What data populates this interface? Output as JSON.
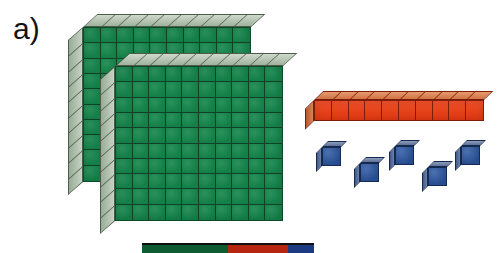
{
  "figure": {
    "label": "a)",
    "kind": "base-ten-blocks",
    "represented_value": 215,
    "background_color": "#ffffff",
    "width": 498,
    "height": 253
  },
  "groups": {
    "hundreds": {
      "name": "hundred-flat",
      "count": 2,
      "unit_value": 100,
      "grid_rows": 10,
      "grid_cols": 10,
      "color": "#13854a",
      "edge_color": "#0c4a2a",
      "bevel_color": "#b7c6b4",
      "items": [
        {
          "id": "flat-back",
          "left": 68,
          "top": 14
        },
        {
          "id": "flat-front",
          "left": 100,
          "top": 53
        }
      ]
    },
    "tens": {
      "name": "ten-rod",
      "count": 1,
      "unit_value": 10,
      "segments": 10,
      "color": "#eb3b11",
      "edge_color": "#7d1c08",
      "bevel_color": "#e79b6d",
      "items": [
        {
          "id": "rod-1",
          "left": 305,
          "top": 91
        }
      ]
    },
    "ones": {
      "name": "unit-cube",
      "count": 5,
      "unit_value": 1,
      "color": "#2a55a0",
      "edge_color": "#15294f",
      "bevel_color": "#7b8cab",
      "items": [
        {
          "id": "unit-1",
          "left": 316,
          "top": 141
        },
        {
          "id": "unit-2",
          "left": 354,
          "top": 157
        },
        {
          "id": "unit-3",
          "left": 389,
          "top": 140
        },
        {
          "id": "unit-4",
          "left": 422,
          "top": 161
        },
        {
          "id": "unit-5",
          "left": 455,
          "top": 140
        }
      ]
    }
  },
  "bottom_strip": {
    "name": "cropped-next-figure-strip",
    "segments": [
      {
        "color": "#0d5c32",
        "width": 86
      },
      {
        "color": "#b52510",
        "width": 60
      },
      {
        "color": "#1c3a82",
        "width": 26
      }
    ]
  }
}
